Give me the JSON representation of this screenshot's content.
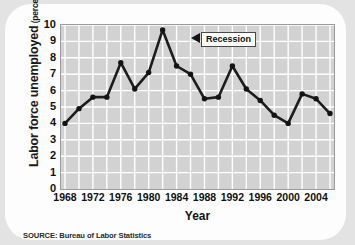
{
  "card": {
    "source_note": "SOURCE: Bureau of Labor Statistics"
  },
  "axis": {
    "y_title_main": "Labor force unemployed",
    "y_title_unit": "(percentage)",
    "x_title": "Year"
  },
  "annotation": {
    "label": "Recession",
    "pointer": "left-triangle-pointer"
  },
  "colors": {
    "page_background": "#e3e3e3",
    "card_background": "#fdfdfd",
    "plot_background": "#d2d2d2",
    "gridline": "#ffffff",
    "plot_border": "#9b9b9b",
    "line": "#1c1c1c",
    "marker": "#141414",
    "text": "#111111"
  },
  "chart_data": {
    "type": "line",
    "title": "",
    "subtitle": "",
    "xlabel": "Year",
    "ylabel": "Labor force unemployed (percentage)",
    "xlim": [
      1968,
      2006
    ],
    "ylim": [
      0,
      10
    ],
    "ytick_labels": [
      "0",
      "1",
      "2",
      "3",
      "4",
      "5",
      "6",
      "7",
      "8",
      "9",
      "10"
    ],
    "ytick_values": [
      0,
      1,
      2,
      3,
      4,
      5,
      6,
      7,
      8,
      9,
      10
    ],
    "xtick_labels": [
      "1968",
      "1972",
      "1976",
      "1980",
      "1984",
      "1988",
      "1992",
      "1996",
      "2000",
      "2004"
    ],
    "xtick_values": [
      1968,
      1972,
      1976,
      1980,
      1984,
      1988,
      1992,
      1996,
      2000,
      2004
    ],
    "grid": true,
    "grid_x_values": [
      1968,
      1970,
      1972,
      1974,
      1976,
      1978,
      1980,
      1982,
      1984,
      1986,
      1988,
      1990,
      1992,
      1994,
      1996,
      1998,
      2000,
      2002,
      2004,
      2006
    ],
    "grid_y_values": [
      0,
      1,
      2,
      3,
      4,
      5,
      6,
      7,
      8,
      9,
      10
    ],
    "legend": null,
    "legend_position": "none",
    "markers": true,
    "x": [
      1968,
      1970,
      1972,
      1974,
      1976,
      1978,
      1980,
      1982,
      1984,
      1986,
      1988,
      1990,
      1992,
      1994,
      1996,
      1998,
      2000,
      2002,
      2004,
      2006
    ],
    "values": [
      4.0,
      4.9,
      5.6,
      5.6,
      7.7,
      6.1,
      7.1,
      9.7,
      7.5,
      7.0,
      5.5,
      5.6,
      7.5,
      6.1,
      5.4,
      4.5,
      4.0,
      5.8,
      5.5,
      4.6
    ],
    "series": [
      {
        "name": "Unemployment rate",
        "x": [
          1968,
          1970,
          1972,
          1974,
          1976,
          1978,
          1980,
          1982,
          1984,
          1986,
          1988,
          1990,
          1992,
          1994,
          1996,
          1998,
          2000,
          2002,
          2004,
          2006
        ],
        "values": [
          4.0,
          4.9,
          5.6,
          5.6,
          7.7,
          6.1,
          7.1,
          9.7,
          7.5,
          7.0,
          5.5,
          5.6,
          7.5,
          6.1,
          5.4,
          4.5,
          4.0,
          5.8,
          5.5,
          4.6
        ]
      }
    ],
    "annotations": [
      {
        "text": "Recession",
        "x": 1982,
        "y": 9.7
      }
    ]
  }
}
